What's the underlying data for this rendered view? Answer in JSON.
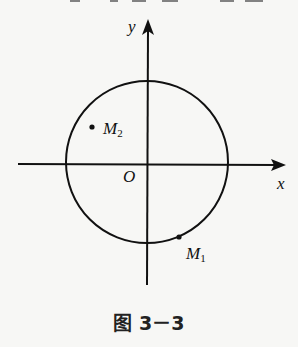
{
  "figure": {
    "caption": "图 3－3",
    "axes": {
      "x_label": "x",
      "y_label": "y",
      "origin_label": "O"
    },
    "circle": {
      "center": [
        147,
        162
      ],
      "radius": 81
    },
    "points": [
      {
        "name": "M",
        "sub": "2",
        "position": [
          92,
          127
        ]
      },
      {
        "name": "M",
        "sub": "1",
        "position": [
          179,
          237
        ]
      }
    ],
    "colors": {
      "ink": "#111111",
      "background": "#f7f7f5"
    }
  }
}
